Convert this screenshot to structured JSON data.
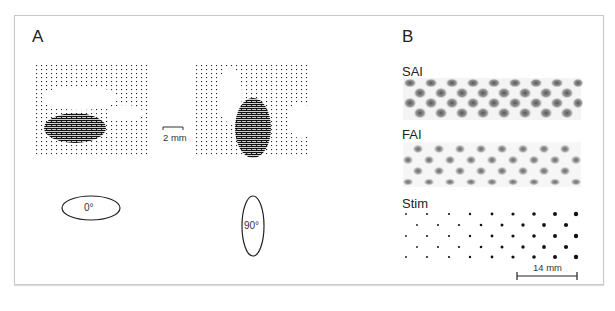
{
  "figure": {
    "panel_a": {
      "label": "A",
      "scale_bar_label": "2 mm",
      "orientations": [
        {
          "label": "0°",
          "shape": "horizontal-ellipse"
        },
        {
          "label": "90°",
          "shape": "vertical-ellipse"
        }
      ]
    },
    "panel_b": {
      "label": "B",
      "rows": [
        {
          "label": "SAI"
        },
        {
          "label": "FAI"
        },
        {
          "label": "Stim"
        }
      ],
      "scale_bar_label": "14 mm"
    }
  }
}
